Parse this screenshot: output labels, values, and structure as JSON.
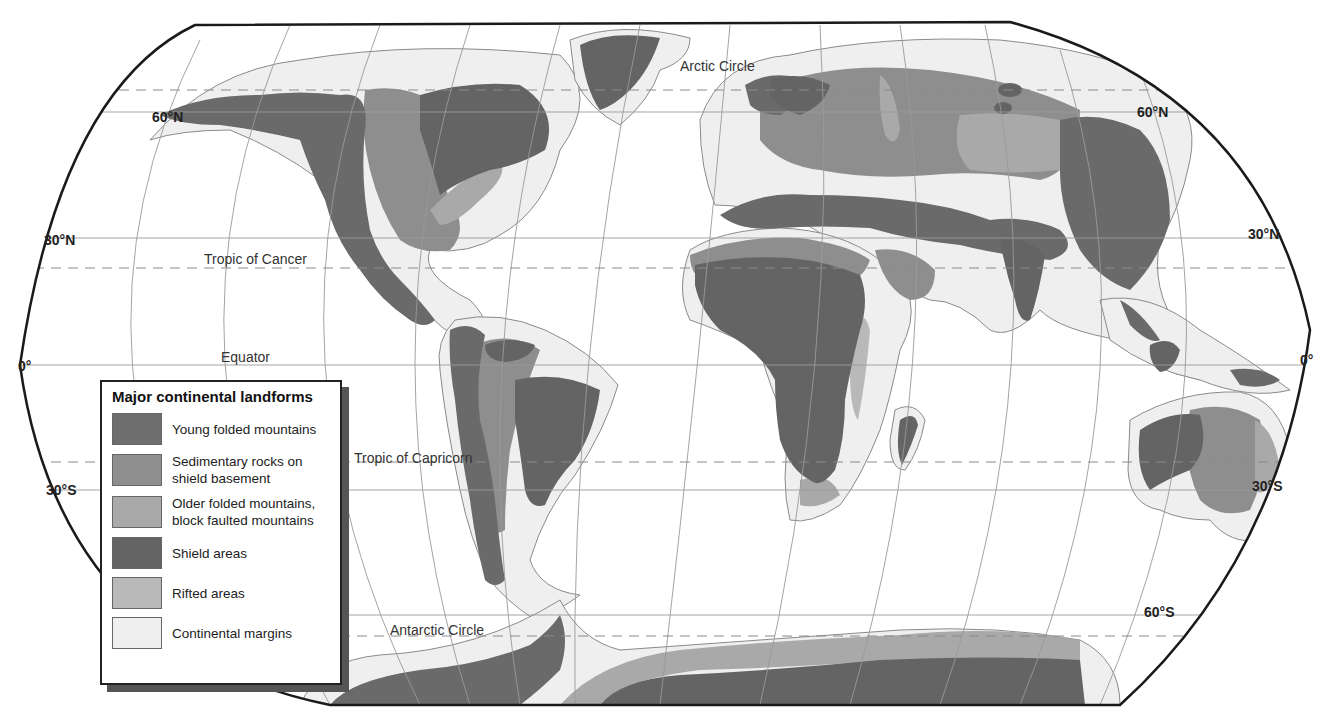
{
  "map": {
    "title": "Major continental landforms",
    "projection_outline": "rounded-rectangle (Robinson-like)",
    "ocean_color": "#ffffff",
    "graticule_color": "#999999",
    "outline_color": "#1a1a1a"
  },
  "legend": {
    "title": "Major continental landforms",
    "items": [
      {
        "label": "Young folded mountains",
        "color": "#6e6e6e"
      },
      {
        "label": "Sedimentary rocks on shield basement",
        "color": "#8e8e8e"
      },
      {
        "label": "Older folded mountains, block faulted mountains",
        "color": "#a9a9a9"
      },
      {
        "label": "Shield areas",
        "color": "#646464"
      },
      {
        "label": "Rifted areas",
        "color": "#b9b9b9"
      },
      {
        "label": "Continental margins",
        "color": "#efefef"
      }
    ]
  },
  "latitude_labels": {
    "left_60n": "60°N",
    "left_30n": "30°N",
    "left_0": "0°",
    "left_30s": "30°S",
    "right_60n": "60°N",
    "right_30n": "30°N",
    "right_0": "0°",
    "right_30s": "30°S",
    "right_60s": "60°S"
  },
  "circle_labels": {
    "arctic": "Arctic Circle",
    "cancer": "Tropic of Cancer",
    "equator": "Equator",
    "capricorn": "Tropic of Capricorn",
    "antarctic": "Antarctic Circle"
  }
}
